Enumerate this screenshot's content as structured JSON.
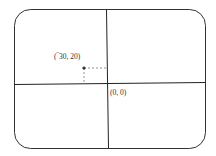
{
  "diagram": {
    "type": "coordinate-plane",
    "frame": {
      "shape": "rounded-rectangle",
      "stroke": "#333333"
    },
    "axes": {
      "stroke": "#222222"
    },
    "origin": {
      "label": "(0, 0)",
      "x": 0,
      "y": 0
    },
    "point": {
      "label": "(‾30, 20)",
      "x": -30,
      "y": 20,
      "color": "#333333"
    },
    "guide_lines": {
      "style": "dashed",
      "color": "#777777"
    }
  }
}
